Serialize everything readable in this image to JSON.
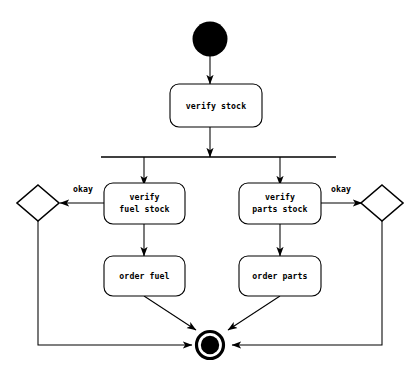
{
  "diagram": {
    "type": "uml-activity-diagram",
    "background_color": "#ffffff",
    "line_color": "#000000",
    "nodes": {
      "initial": {
        "kind": "initial-node",
        "label": ""
      },
      "verify_stock": {
        "kind": "action",
        "label": "verify stock"
      },
      "fork": {
        "kind": "fork-bar",
        "label": ""
      },
      "verify_fuel_stock": {
        "kind": "action",
        "label_line1": "verify",
        "label_line2": "fuel stock"
      },
      "verify_parts_stock": {
        "kind": "action",
        "label_line1": "verify",
        "label_line2": "parts stock"
      },
      "order_fuel": {
        "kind": "action",
        "label": "order fuel"
      },
      "order_parts": {
        "kind": "action",
        "label": "order parts"
      },
      "decision_left": {
        "kind": "decision",
        "label": ""
      },
      "decision_right": {
        "kind": "decision",
        "label": ""
      },
      "final": {
        "kind": "activity-final-node",
        "label": ""
      }
    },
    "edges": {
      "initial_to_verify_stock": {
        "label": ""
      },
      "verify_stock_to_fork": {
        "label": ""
      },
      "fork_to_verify_fuel": {
        "label": ""
      },
      "fork_to_verify_parts": {
        "label": ""
      },
      "verify_fuel_to_decision_left": {
        "label": "okay"
      },
      "verify_parts_to_decision_right": {
        "label": "okay"
      },
      "verify_fuel_to_order_fuel": {
        "label": ""
      },
      "verify_parts_to_order_parts": {
        "label": ""
      },
      "order_fuel_to_final": {
        "label": ""
      },
      "order_parts_to_final": {
        "label": ""
      },
      "decision_left_to_final": {
        "label": ""
      },
      "decision_right_to_final": {
        "label": ""
      }
    }
  }
}
